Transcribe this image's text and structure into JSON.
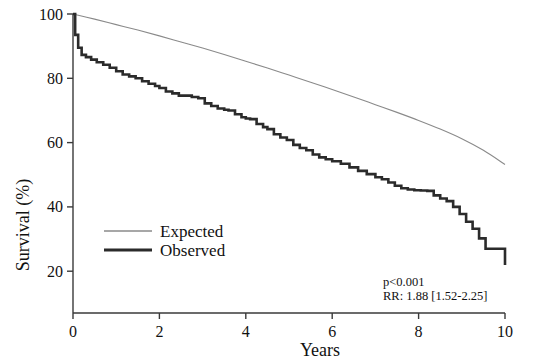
{
  "figure": {
    "width": 534,
    "height": 364,
    "background": "#ffffff"
  },
  "chart_data": {
    "type": "line",
    "title": "",
    "subtitle": "",
    "xlabel": "Years",
    "ylabel": "Survival (%)",
    "xlim": [
      0,
      10
    ],
    "ylim": [
      7,
      100
    ],
    "xticks": [
      0,
      2,
      4,
      6,
      8,
      10
    ],
    "xtick_labels": [
      "0",
      "2",
      "4",
      "6",
      "8",
      "10"
    ],
    "yticks": [
      20,
      40,
      60,
      80,
      100
    ],
    "ytick_labels": [
      "20",
      "40",
      "60",
      "80",
      "100"
    ],
    "grid": false,
    "frame": "open-left-bottom",
    "legend_position": "inside-left-lower",
    "series": [
      {
        "name": "Expected",
        "color": "#8a8a8a",
        "line_width": 1.1,
        "style": "smooth",
        "x": [
          0,
          0.5,
          1,
          1.5,
          2,
          2.5,
          3,
          3.5,
          4,
          4.5,
          5,
          5.5,
          6,
          6.5,
          7,
          7.5,
          8,
          8.5,
          9,
          9.5,
          10
        ],
        "values": [
          100,
          98.4,
          96.7,
          95.0,
          93.2,
          91.3,
          89.4,
          87.4,
          85.3,
          83.2,
          81.0,
          78.8,
          76.5,
          74.2,
          71.8,
          69.4,
          66.9,
          64.2,
          61.2,
          57.6,
          53.2
        ]
      },
      {
        "name": "Observed",
        "color": "#2b2b2b",
        "line_width": 2.6,
        "style": "step",
        "x": [
          0,
          0.05,
          0.12,
          0.2,
          0.3,
          0.42,
          0.55,
          0.7,
          0.85,
          1.0,
          1.15,
          1.3,
          1.45,
          1.6,
          1.75,
          1.9,
          2.0,
          2.15,
          2.3,
          2.45,
          2.6,
          2.75,
          2.9,
          3.05,
          3.2,
          3.35,
          3.5,
          3.6,
          3.75,
          3.9,
          4.0,
          4.1,
          4.25,
          4.4,
          4.5,
          4.65,
          4.8,
          4.95,
          5.1,
          5.25,
          5.4,
          5.55,
          5.7,
          5.85,
          6.0,
          6.2,
          6.4,
          6.6,
          6.8,
          7.0,
          7.15,
          7.3,
          7.45,
          7.6,
          7.75,
          7.9,
          8.05,
          8.2,
          8.35,
          8.5,
          8.65,
          8.8,
          8.95,
          9.1,
          9.25,
          9.4,
          9.55,
          10
        ],
        "values": [
          100,
          93.5,
          89.5,
          87.3,
          86.6,
          85.8,
          85.0,
          84.2,
          83.3,
          82.2,
          81.2,
          80.6,
          80.0,
          79.1,
          78.3,
          77.6,
          77.0,
          75.9,
          75.3,
          74.6,
          74.6,
          74.2,
          73.8,
          72.2,
          71.4,
          70.6,
          70.2,
          70.0,
          68.8,
          67.9,
          67.5,
          67.3,
          65.8,
          64.8,
          64.2,
          62.6,
          61.6,
          60.8,
          59.3,
          58.3,
          57.6,
          56.3,
          55.4,
          54.8,
          54.2,
          53.4,
          52.3,
          51.2,
          50.2,
          49.2,
          48.6,
          47.6,
          46.6,
          45.8,
          45.4,
          45.2,
          45.1,
          45.0,
          43.6,
          42.6,
          41.8,
          40.0,
          37.8,
          35.4,
          33.2,
          30.2,
          27.0,
          21.9
        ]
      }
    ],
    "annotations": [
      {
        "id": "pvalue",
        "text": "p<0.001"
      },
      {
        "id": "risk-ratio",
        "text": "RR: 1.88 [1.52-2.25]"
      }
    ]
  },
  "legend": {
    "items": [
      {
        "label": "Expected"
      },
      {
        "label": "Observed"
      }
    ]
  }
}
